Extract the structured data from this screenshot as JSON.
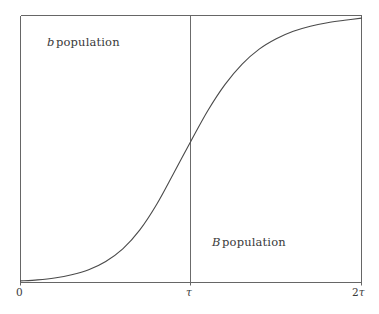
{
  "figure": {
    "background_color": "#ffffff",
    "line_color": "#555555",
    "curve_color": "#4a4a4a",
    "text_color": "#3a3a3a"
  },
  "labels": {
    "b_population": {
      "symbol": "b",
      "text": "population",
      "full": "b population"
    },
    "B_population": {
      "symbol": "B",
      "text": "population",
      "full": "B population"
    }
  },
  "axis": {
    "ticks": [
      {
        "name": "origin",
        "label": "0",
        "symbol": "",
        "x_value": 0
      },
      {
        "name": "tau",
        "label": "",
        "symbol": "τ",
        "x_value": 1
      },
      {
        "name": "two-tau",
        "label": "2",
        "symbol": "τ",
        "x_value": 2
      }
    ]
  },
  "chart_data": {
    "type": "line",
    "title": "",
    "xlabel": "",
    "ylabel": "",
    "xlim": [
      0,
      2
    ],
    "ylim": [
      0,
      1
    ],
    "grid": false,
    "legend": "none",
    "annotations": [
      {
        "text": "b population",
        "x": 0.44,
        "y": 0.9
      },
      {
        "text": "B population",
        "x": 1.41,
        "y": 0.16
      }
    ],
    "vertical_rules": [
      {
        "name": "tau-divider",
        "x": 1.0,
        "y_from": 0.0,
        "y_to": 1.0
      }
    ],
    "xticks": [
      0,
      1,
      2
    ],
    "xticklabels": [
      "0",
      "τ",
      "2τ"
    ],
    "series": [
      {
        "name": "B population fraction",
        "comment": "logistic / sigmoid transition crossing 0.5 at x = tau",
        "x": [
          0.0,
          0.1,
          0.2,
          0.3,
          0.4,
          0.5,
          0.6,
          0.7,
          0.8,
          0.9,
          1.0,
          1.1,
          1.2,
          1.3,
          1.4,
          1.5,
          1.6,
          1.7,
          1.8,
          1.9,
          2.0
        ],
        "y": [
          0.006,
          0.01,
          0.017,
          0.029,
          0.048,
          0.079,
          0.126,
          0.197,
          0.294,
          0.411,
          0.53,
          0.645,
          0.742,
          0.818,
          0.874,
          0.913,
          0.941,
          0.96,
          0.973,
          0.982,
          0.99
        ]
      }
    ]
  }
}
